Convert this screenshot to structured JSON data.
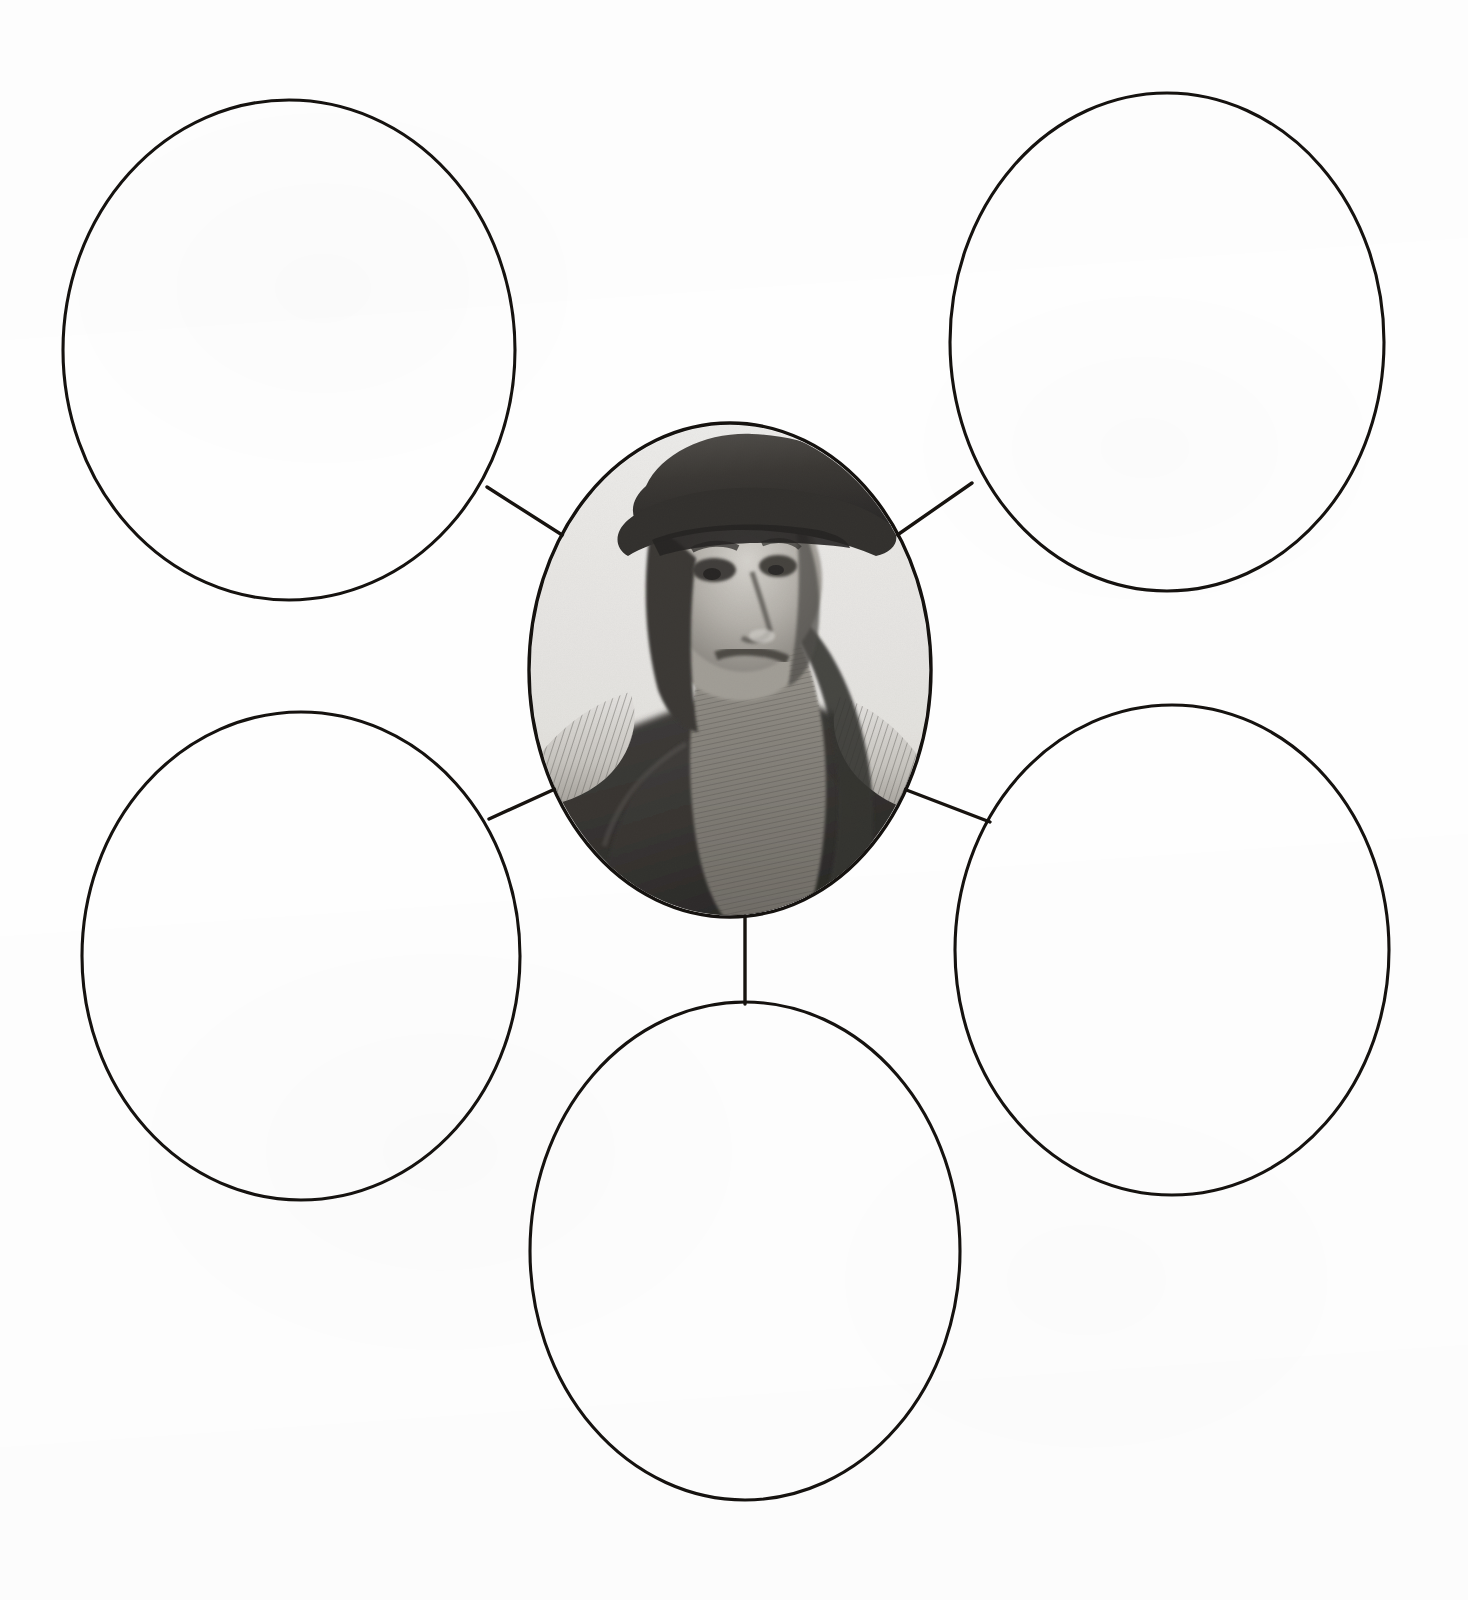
{
  "document": {
    "kind": "graphic-organizer-worksheet",
    "layout": "spider-web-diagram",
    "background_color": "#fefefe",
    "ink_color": "#15120f",
    "canvas": {
      "width": 1468,
      "height": 1600
    }
  },
  "center_node": {
    "name": "center-portrait-oval",
    "label": "",
    "has_image": true,
    "image": {
      "kind": "engraved-portrait",
      "subject": "bearded man in flat cap and fur-collared robe",
      "style": "black-and-white halftone engraving",
      "orientation": "three-quarter profile facing right",
      "features": [
        "dark flat cap",
        "long flowing beard",
        "deep-set eyes",
        "dark robe",
        "pale feathered ruff collar on both shoulders"
      ],
      "tone_dark": "#2a2724",
      "tone_mid": "#8d8a85",
      "tone_light": "#e8e6e2"
    },
    "geometry": {
      "cx": 730,
      "cy": 670,
      "rx": 202,
      "ry": 248
    }
  },
  "branch_nodes": [
    {
      "name": "oval-top-left",
      "label": "",
      "position": "top-left",
      "geometry": {
        "cx": 289,
        "cy": 350,
        "rx": 226,
        "ry": 250
      }
    },
    {
      "name": "oval-top-right",
      "label": "",
      "position": "top-right",
      "geometry": {
        "cx": 1167,
        "cy": 342,
        "rx": 217,
        "ry": 249
      }
    },
    {
      "name": "oval-middle-left",
      "label": "",
      "position": "middle-left",
      "geometry": {
        "cx": 301,
        "cy": 956,
        "rx": 219,
        "ry": 244
      }
    },
    {
      "name": "oval-middle-right",
      "label": "",
      "position": "middle-right",
      "geometry": {
        "cx": 1172,
        "cy": 950,
        "rx": 217,
        "ry": 245
      }
    },
    {
      "name": "oval-bottom-center",
      "label": "",
      "position": "bottom-center",
      "geometry": {
        "cx": 745,
        "cy": 1251,
        "rx": 215,
        "ry": 249
      }
    }
  ],
  "connectors": [
    {
      "name": "connector-center-to-top-left",
      "from": "center-portrait-oval",
      "to": "oval-top-left",
      "x1": 487,
      "y1": 487,
      "x2": 570,
      "y2": 540
    },
    {
      "name": "connector-center-to-top-right",
      "from": "center-portrait-oval",
      "to": "oval-top-right",
      "x1": 893,
      "y1": 538,
      "x2": 972,
      "y2": 483
    },
    {
      "name": "connector-center-to-middle-left",
      "from": "center-portrait-oval",
      "to": "oval-middle-left",
      "x1": 489,
      "y1": 819,
      "x2": 566,
      "y2": 784
    },
    {
      "name": "connector-center-to-middle-right",
      "from": "center-portrait-oval",
      "to": "oval-middle-right",
      "x1": 896,
      "y1": 786,
      "x2": 990,
      "y2": 822
    },
    {
      "name": "connector-center-to-bottom-center",
      "from": "center-portrait-oval",
      "to": "oval-bottom-center",
      "x1": 745,
      "y1": 916,
      "x2": 745,
      "y2": 1004
    }
  ]
}
